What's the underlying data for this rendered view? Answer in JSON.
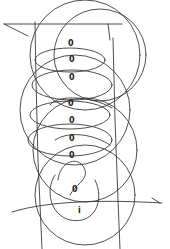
{
  "drawing": {
    "description": "Hand-drawn pencil sketch of overlapping circles/spirals along a vertical axis",
    "stroke_color": "#3a3a3a",
    "background": "#ffffff",
    "markers": [
      {
        "glyph": "0",
        "x": 70,
        "y": 44
      },
      {
        "glyph": "0",
        "x": 71,
        "y": 60
      },
      {
        "glyph": "0",
        "x": 71,
        "y": 78
      },
      {
        "glyph": "0",
        "x": 70,
        "y": 104
      },
      {
        "glyph": "0",
        "x": 71,
        "y": 121
      },
      {
        "glyph": "0",
        "x": 71,
        "y": 139
      },
      {
        "glyph": "0",
        "x": 71,
        "y": 156
      },
      {
        "glyph": "0",
        "x": 74,
        "y": 190
      },
      {
        "glyph": "i",
        "x": 79,
        "y": 211
      }
    ]
  }
}
